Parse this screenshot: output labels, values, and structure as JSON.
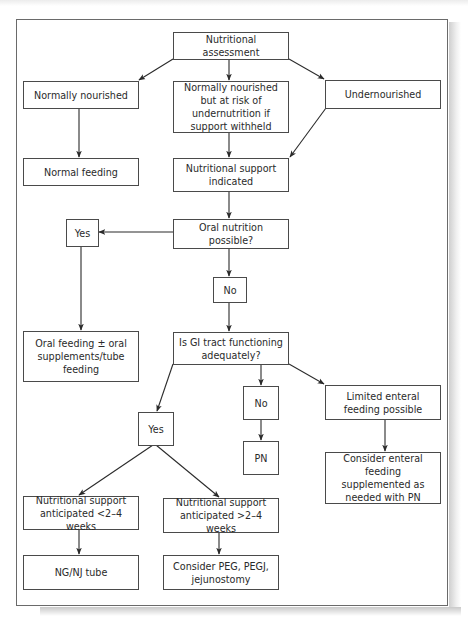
{
  "diagram": {
    "type": "flowchart",
    "nodes": {
      "assessment": "Nutritional assessment",
      "normally_nourished": "Normally nourished",
      "at_risk": "Normally nourished but at risk of undernutrition if support withheld",
      "undernourished": "Undernourished",
      "normal_feeding": "Normal feeding",
      "support_indicated": "Nutritional support indicated",
      "oral_possible": "Oral nutrition possible?",
      "oral_yes": "Yes",
      "oral_no": "No",
      "oral_feeding": "Oral feeding ± oral supplements/tube feeding",
      "gi_functioning": "Is GI tract functioning adequately?",
      "gi_yes": "Yes",
      "gi_no": "No",
      "pn": "PN",
      "limited_enteral": "Limited enteral feeding possible",
      "consider_enteral_pn": "Consider enteral feeding supplemented as needed with PN",
      "short_term": "Nutritional support anticipated <2–4 weeks",
      "long_term": "Nutritional support anticipated >2–4 weeks",
      "ng_nj": "NG/NJ tube",
      "peg": "Consider PEG, PEGJ, jejunostomy"
    },
    "edges": [
      [
        "assessment",
        "normally_nourished"
      ],
      [
        "assessment",
        "at_risk"
      ],
      [
        "assessment",
        "undernourished"
      ],
      [
        "normally_nourished",
        "normal_feeding"
      ],
      [
        "at_risk",
        "support_indicated"
      ],
      [
        "undernourished",
        "support_indicated"
      ],
      [
        "support_indicated",
        "oral_possible"
      ],
      [
        "oral_possible",
        "oral_yes"
      ],
      [
        "oral_possible",
        "oral_no"
      ],
      [
        "oral_yes",
        "oral_feeding"
      ],
      [
        "oral_no",
        "gi_functioning"
      ],
      [
        "gi_functioning",
        "gi_yes"
      ],
      [
        "gi_functioning",
        "gi_no"
      ],
      [
        "gi_functioning",
        "limited_enteral"
      ],
      [
        "gi_no",
        "pn"
      ],
      [
        "limited_enteral",
        "consider_enteral_pn"
      ],
      [
        "gi_yes",
        "short_term"
      ],
      [
        "gi_yes",
        "long_term"
      ],
      [
        "short_term",
        "ng_nj"
      ],
      [
        "long_term",
        "peg"
      ]
    ],
    "colors": {
      "line": "#2a2a2a",
      "box_border": "#4a4a4a",
      "text": "#2a2a2a",
      "frame": "#6a6a6a"
    }
  }
}
